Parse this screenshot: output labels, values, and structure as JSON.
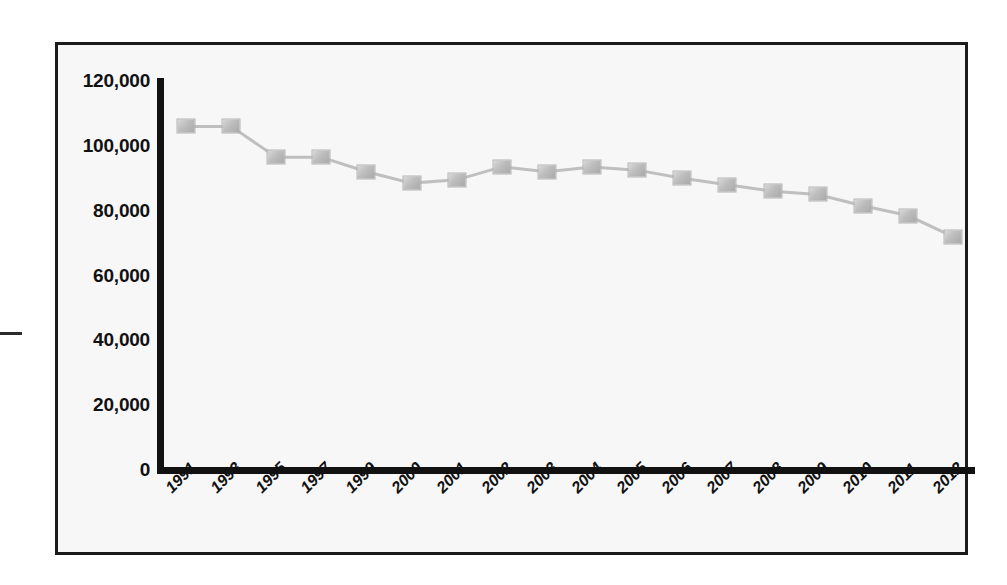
{
  "page": {
    "background_color": "#ffffff",
    "frame_border_color": "#1b1b1b",
    "plot_background_color": "#f7f7f7",
    "axis_color": "#111111",
    "marker_color": "#bdbdbd",
    "line_color": "#bfbfbf"
  },
  "decorations": {
    "left_dash": ""
  },
  "chart_data": {
    "type": "line",
    "title": "",
    "subtitle": "",
    "xlabel": "",
    "ylabel": "",
    "legend": [],
    "legend_position": "none",
    "grid": false,
    "ylim": [
      0,
      120000
    ],
    "yticks": [
      0,
      20000,
      40000,
      60000,
      80000,
      100000,
      120000
    ],
    "ytick_labels": [
      "0",
      "20,000",
      "40,000",
      "60,000",
      "80,000",
      "100,000",
      "120,000"
    ],
    "categories": [
      "1991",
      "1993",
      "1995",
      "1997",
      "1999",
      "2000",
      "2001",
      "2002",
      "2003",
      "2004",
      "2005",
      "2006",
      "2007",
      "2008",
      "2009",
      "2010",
      "2011",
      "2012"
    ],
    "values": [
      106000,
      106000,
      96500,
      96500,
      92000,
      88500,
      89500,
      93500,
      92000,
      93500,
      92500,
      90000,
      88000,
      86000,
      85000,
      81500,
      78500,
      72000
    ],
    "series": [
      {
        "name": "series-1",
        "marker": "square",
        "values": [
          106000,
          106000,
          96500,
          96500,
          92000,
          88500,
          89500,
          93500,
          92000,
          93500,
          92500,
          90000,
          88000,
          86000,
          85000,
          81500,
          78500,
          72000
        ]
      }
    ]
  }
}
